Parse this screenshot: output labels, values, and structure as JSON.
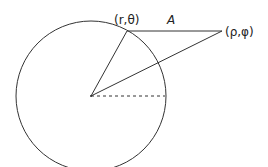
{
  "diagram": {
    "labels": {
      "point_on_circle": "(r,θ)",
      "external_point": "(ρ,φ)",
      "distance": "A"
    },
    "stroke_color": "#333333"
  }
}
